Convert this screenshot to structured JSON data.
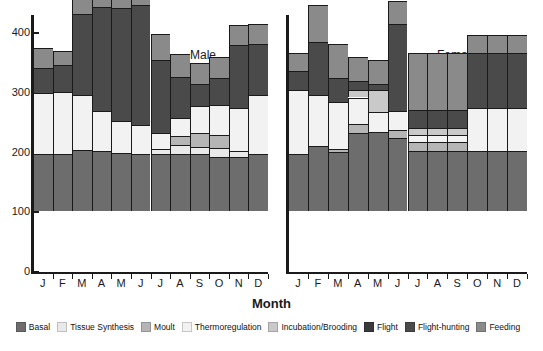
{
  "chart_data": {
    "type": "bar",
    "subtype": "stacked",
    "title": "",
    "xlabel": "Month",
    "ylabel": "",
    "ylim": [
      0,
      420
    ],
    "yticks": [
      0,
      100,
      200,
      300,
      400
    ],
    "ytick_labels": [
      "0",
      "100",
      "200",
      "300",
      "400"
    ],
    "grid": false,
    "legend_position": "bottom",
    "categories": [
      "J",
      "F",
      "M",
      "A",
      "M",
      "J",
      "J",
      "A",
      "S",
      "O",
      "N",
      "D"
    ],
    "panels": [
      {
        "name": "Male",
        "label": "Male",
        "series": [
          {
            "name": "Basal",
            "values": [
              95,
              95,
              102,
              100,
              97,
              96,
              96,
              95,
              95,
              90,
              90,
              96
            ]
          },
          {
            "name": "Tissue Synthesis",
            "values": [
              0,
              0,
              0,
              0,
              0,
              0,
              7,
              16,
              12,
              15,
              10,
              0
            ]
          },
          {
            "name": "Moult",
            "values": [
              0,
              0,
              0,
              0,
              0,
              0,
              0,
              14,
              24,
              23,
              0,
              0
            ]
          },
          {
            "name": "Thermoregulation",
            "values": [
              103,
              105,
              92,
              67,
              53,
              48,
              27,
              30,
              44,
              50,
              73,
              98
            ]
          },
          {
            "name": "Incubation/Brooding",
            "values": [
              0,
              0,
              0,
              0,
              0,
              0,
              0,
              0,
              0,
              0,
              0,
              0
            ]
          },
          {
            "name": "Flight",
            "values": [
              0,
              0,
              0,
              0,
              0,
              0,
              0,
              0,
              0,
              0,
              0,
              0
            ]
          },
          {
            "name": "Flight-hunting",
            "values": [
              42,
              44,
              136,
              175,
              190,
              200,
              123,
              70,
              37,
              45,
              105,
              86
            ]
          },
          {
            "name": "Feeding",
            "values": [
              33,
              23,
              33,
              32,
              32,
              53,
              44,
              37,
              35,
              35,
              33,
              33
            ]
          }
        ],
        "totals": [
          273,
          267,
          363,
          374,
          372,
          397,
          297,
          262,
          247,
          258,
          311,
          313
        ]
      },
      {
        "name": "Female",
        "label": "Female",
        "series": [
          {
            "name": "Basal",
            "values": [
              95,
              108,
              98,
              130,
              133,
              122,
              100,
              100,
              100,
              100,
              100,
              100
            ]
          },
          {
            "name": "Tissue Synthesis",
            "values": [
              0,
              0,
              0,
              0,
              0,
              0,
              0,
              0,
              0,
              0,
              0,
              0
            ]
          },
          {
            "name": "Moult",
            "values": [
              0,
              0,
              5,
              15,
              0,
              13,
              15,
              15,
              15,
              0,
              0,
              0
            ]
          },
          {
            "name": "Thermoregulation",
            "values": [
              107,
              87,
              80,
              45,
              32,
              33,
              12,
              12,
              12,
              72,
              72,
              72
            ]
          },
          {
            "name": "Incubation/Brooding",
            "values": [
              0,
              0,
              0,
              12,
              38,
              0,
              12,
              12,
              12,
              0,
              0,
              0
            ]
          },
          {
            "name": "Flight",
            "values": [
              0,
              0,
              0,
              0,
              0,
              0,
              0,
              0,
              0,
              0,
              0,
              0
            ]
          },
          {
            "name": "Flight-hunting",
            "values": [
              33,
              88,
              40,
              15,
              9,
              145,
              30,
              30,
              30,
              93,
              93,
              93
            ]
          },
          {
            "name": "Feeding",
            "values": [
              30,
              62,
              57,
              40,
              40,
              38,
              95,
              95,
              95,
              30,
              30,
              30
            ]
          }
        ],
        "totals": [
          265,
          345,
          280,
          257,
          252,
          351,
          264,
          264,
          264,
          295,
          295,
          295
        ]
      }
    ],
    "legend": [
      {
        "label": "Basal",
        "color": "#6d6d6d"
      },
      {
        "label": "Tissue Synthesis",
        "color": "#e9e9e9"
      },
      {
        "label": "Moult",
        "color": "#b5b5b5"
      },
      {
        "label": "Thermoregulation",
        "color": "#f2f2f2"
      },
      {
        "label": "Incubation/Brooding",
        "color": "#c9c9c9"
      },
      {
        "label": "Flight",
        "color": "#3a3a3a"
      },
      {
        "label": "Flight-hunting",
        "color": "#4a4a4a"
      },
      {
        "label": "Feeding",
        "color": "#8a8a8a"
      }
    ],
    "colors": {
      "basal": "#6d6d6d",
      "tissue_synthesis": "#e9e9e9",
      "moult": "#b5b5b5",
      "thermoregulation": "#f2f2f2",
      "incubation_brooding": "#c9c9c9",
      "flight": "#3a3a3a",
      "flight_hunting": "#4a4a4a",
      "feeding": "#8a8a8a",
      "axis": "#1a1a1a",
      "background": "#ffffff"
    }
  }
}
